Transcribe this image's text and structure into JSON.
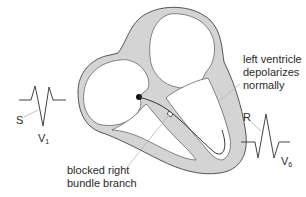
{
  "diagram": {
    "colors": {
      "myocardium_fill": "#d4d4d4",
      "outline": "#555555",
      "conduction_path": "#333333",
      "leader_line": "#aaaaaa",
      "text": "#2a2a2a",
      "background": "#ffffff"
    },
    "annotations": {
      "left_ventricle": {
        "line1": "left ventricle",
        "line2": "depolarizes",
        "line3": "normally"
      },
      "blocked_branch": {
        "line1": "blocked right",
        "line2": "bundle branch"
      }
    },
    "ecg_leads": {
      "v1": {
        "lead_letter": "V",
        "lead_sub": "1",
        "wave_label": "S",
        "description": "rSR' pattern with deep S"
      },
      "v6": {
        "lead_letter": "V",
        "lead_sub": "6",
        "wave_label": "R",
        "description": "tall R with S waves"
      }
    },
    "structures": [
      "right-atrium",
      "left-atrium",
      "right-ventricle",
      "left-ventricle",
      "av-node",
      "left-bundle-branch",
      "blocked-right-bundle-branch"
    ]
  }
}
